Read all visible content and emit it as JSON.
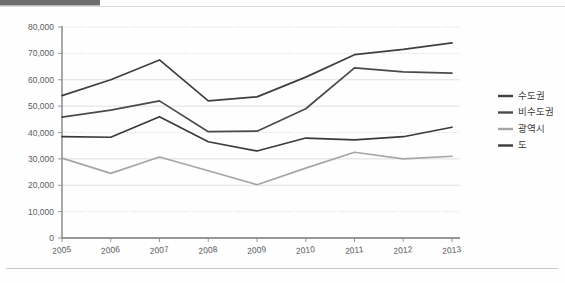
{
  "chart_data": {
    "type": "line",
    "title": "",
    "xlabel": "",
    "ylabel": "",
    "categories": [
      "2005",
      "2006",
      "2007",
      "2008",
      "2009",
      "2010",
      "2011",
      "2012",
      "2013"
    ],
    "ylim": [
      0,
      80000
    ],
    "yticks": [
      0,
      10000,
      20000,
      30000,
      40000,
      50000,
      60000,
      70000,
      80000
    ],
    "ytick_labels": [
      "0",
      "10,000",
      "20,000",
      "30,000",
      "40,000",
      "50,000",
      "60,000",
      "70,000",
      "80,000"
    ],
    "grid": true,
    "legend_position": "right",
    "series": [
      {
        "name": "수도권",
        "color": "#3f3f3f",
        "values": [
          54000,
          60000,
          67500,
          52000,
          53500,
          61000,
          69500,
          71500,
          74000
        ]
      },
      {
        "name": "비수도권",
        "color": "#4a4a4a",
        "values": [
          45800,
          48500,
          52000,
          40300,
          40500,
          49000,
          64500,
          63000,
          62500
        ]
      },
      {
        "name": "광역시",
        "color": "#a6a6a6",
        "values": [
          30300,
          24500,
          30700,
          25500,
          20200,
          26500,
          32500,
          30000,
          31000
        ]
      },
      {
        "name": "도",
        "color": "#3a3a3a",
        "values": [
          38400,
          38200,
          46000,
          36500,
          33000,
          37900,
          37200,
          38400,
          42000
        ]
      }
    ]
  },
  "legend": {
    "items": [
      {
        "label": "수도권",
        "color": "#3f3f3f"
      },
      {
        "label": "비수도권",
        "color": "#4a4a4a"
      },
      {
        "label": "광역시",
        "color": "#a6a6a6"
      },
      {
        "label": "도",
        "color": "#3a3a3a"
      }
    ]
  },
  "colors": {
    "top_bar": "#6e6e6e",
    "axis": "#7a7a7a",
    "gridline": "#d2d2d2",
    "background": "#fefefe"
  }
}
